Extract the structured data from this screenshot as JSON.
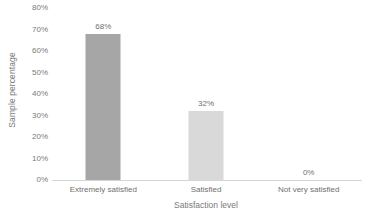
{
  "chart_data": {
    "type": "bar",
    "title": "",
    "xlabel": "Satisfaction level",
    "ylabel": "Sample percentage",
    "categories": [
      "Extremely satisfied",
      "Satisfied",
      "Not very satisfied"
    ],
    "values": [
      68,
      32,
      0
    ],
    "value_labels": [
      "68%",
      "32%",
      "0%"
    ],
    "ylim": [
      0,
      80
    ],
    "ytick_values": [
      0,
      10,
      20,
      30,
      40,
      50,
      60,
      70,
      80
    ],
    "ytick_labels": [
      "0%",
      "10%",
      "20%",
      "30%",
      "40%",
      "50%",
      "60%",
      "70%",
      "80%"
    ],
    "grid": false,
    "legend": false,
    "bar_colors": [
      "#a6a6a6",
      "#d9d9d9",
      "#d9d9d9"
    ],
    "background_color": "#ffffff",
    "axis_line_color": "#d4d4d4",
    "label_color": "#6f6f6f",
    "title_color": "#7a7a7a"
  }
}
